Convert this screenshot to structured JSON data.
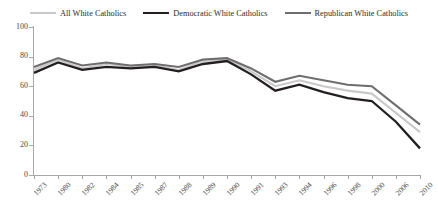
{
  "chart_data": {
    "type": "line",
    "title": "",
    "subtitle": "",
    "xlabel": "",
    "ylabel": "",
    "ylim": [
      0,
      100
    ],
    "ytick_values": [
      0,
      20,
      40,
      60,
      80,
      100
    ],
    "ytick_labels": [
      "0",
      "20",
      "40",
      "60",
      "80",
      "100"
    ],
    "grid": false,
    "legend_position": "top-center",
    "categories": [
      "1973",
      "1980",
      "1982",
      "1984",
      "1985",
      "1987",
      "1988",
      "1989",
      "1990",
      "1991",
      "1993",
      "1994",
      "1996",
      "1998",
      "2000",
      "2006",
      "2010"
    ],
    "series": [
      {
        "name": "All White Catholics",
        "color": "#c9c9c9",
        "width": 2.1,
        "values": [
          71,
          78,
          72,
          75,
          73,
          74,
          71,
          77,
          78,
          70,
          60,
          64,
          60,
          57,
          55,
          42,
          29
        ]
      },
      {
        "name": "Democratic White Catholics",
        "color": "#231f20",
        "width": 2.3,
        "values": [
          69,
          76,
          71,
          73,
          72,
          73,
          70,
          75,
          77,
          68,
          57,
          61,
          56,
          52,
          50,
          36,
          18
        ]
      },
      {
        "name": "Republican White Catholics",
        "color": "#6e6e6e",
        "width": 2.1,
        "values": [
          73,
          79,
          74,
          76,
          74,
          75,
          73,
          78,
          79,
          72,
          63,
          67,
          64,
          61,
          60,
          47,
          34
        ]
      }
    ]
  },
  "legend": {
    "items": [
      {
        "label": "All White Catholics",
        "color": "#c9c9c9"
      },
      {
        "label": "Democratic White Catholics",
        "color": "#231f20"
      },
      {
        "label": "Republican White Catholics",
        "color": "#6e6e6e"
      }
    ]
  }
}
